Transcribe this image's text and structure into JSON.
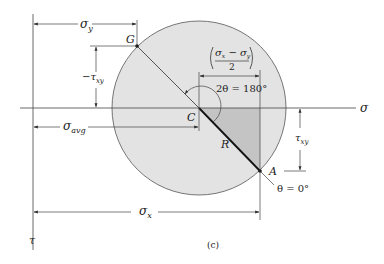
{
  "figure": {
    "caption": "(c)",
    "axes": {
      "horizontal": "σ",
      "vertical": "τ"
    },
    "points": {
      "center": "C",
      "G": "G",
      "A": "A",
      "radius": "R"
    },
    "dimensions": {
      "sigma_y": {
        "main": "σ",
        "sub": "y"
      },
      "neg_tau_xy": {
        "main": "−τ",
        "sub": "xy"
      },
      "sigma_avg": {
        "main": "σ",
        "sub": "avg"
      },
      "sigma_x": {
        "main": "σ",
        "sub": "x"
      },
      "tau_xy": {
        "main": "τ",
        "sub": "xy"
      },
      "half_diff": {
        "numerator": "σx − σy",
        "num_a": "σ",
        "num_a_sub": "x",
        "minus": " − ",
        "num_b": "σ",
        "num_b_sub": "y",
        "denominator": "2"
      }
    },
    "angles": {
      "two_theta": "2θ = 180°",
      "theta_A": "θ = 0°"
    },
    "colors": {
      "circle_fill": "#e3e3e3",
      "triangle_fill": "#c4c4c4",
      "line": "#333333"
    }
  }
}
